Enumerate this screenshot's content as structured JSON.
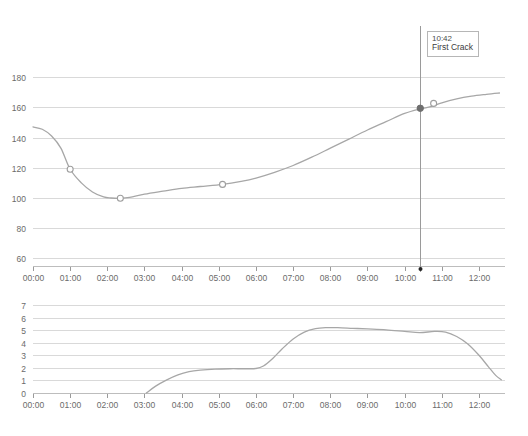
{
  "annotation": {
    "time": "10:42",
    "label": "First Crack"
  },
  "footer": {
    "faint_text": ""
  },
  "colors": {
    "grid": "#d9d9d9",
    "axis": "#bdbdbd",
    "series": "#a7a7a7",
    "marker_open_stroke": "#9e9e9e",
    "marker_filled": "#6e6e6e",
    "event_line": "#9a9a9a",
    "text": "#6b6b6b",
    "background": "#ffffff"
  },
  "chart_data": [
    {
      "type": "line",
      "name": "bean-temperature",
      "title": "",
      "xlabel": "",
      "ylabel": "",
      "xlim": [
        0,
        12.7
      ],
      "ylim": [
        55,
        190
      ],
      "yticks": [
        60,
        80,
        100,
        120,
        140,
        160,
        180
      ],
      "ytick_labels": [
        "60",
        "80",
        "100",
        "120",
        "140",
        "160",
        "180"
      ],
      "xticks": [
        0,
        1,
        2,
        3,
        4,
        5,
        6,
        7,
        8,
        9,
        10,
        11,
        12
      ],
      "xtick_labels": [
        "00:00",
        "01:00",
        "02:00",
        "03:00",
        "04:00",
        "05:00",
        "06:00",
        "07:00",
        "08:00",
        "09:00",
        "10:00",
        "11:00",
        "12:00"
      ],
      "grid": true,
      "legend": "none",
      "x": [
        0.0,
        0.25,
        0.5,
        0.75,
        1.0,
        1.3,
        1.6,
        1.9,
        2.1,
        2.35,
        2.6,
        3.0,
        3.5,
        4.0,
        4.5,
        5.1,
        5.6,
        6.0,
        6.5,
        7.0,
        7.5,
        8.0,
        8.5,
        9.0,
        9.5,
        10.0,
        10.42,
        10.7,
        11.0,
        11.4,
        11.8,
        12.2,
        12.55
      ],
      "y": [
        147,
        145.5,
        141,
        133,
        119,
        110,
        104,
        100.7,
        100.0,
        99.8,
        100.4,
        102.5,
        104.5,
        106.4,
        107.6,
        109.0,
        111.0,
        113.2,
        117.0,
        121.5,
        127.0,
        133.0,
        139.0,
        145.0,
        150.5,
        156.0,
        159.0,
        160.4,
        163.0,
        165.6,
        167.4,
        168.6,
        169.5
      ],
      "markers": [
        {
          "x": 1.0,
          "y": 119,
          "style": "open"
        },
        {
          "x": 2.35,
          "y": 99.8,
          "style": "open"
        },
        {
          "x": 5.1,
          "y": 109.0,
          "style": "open"
        },
        {
          "x": 10.42,
          "y": 159.4,
          "style": "filled"
        },
        {
          "x": 10.78,
          "y": 162.6,
          "style": "open"
        }
      ],
      "event_marker": {
        "x": 10.42,
        "label": "First Crack",
        "time": "10:42"
      }
    },
    {
      "type": "line",
      "name": "rate-of-rise",
      "title": "",
      "xlabel": "",
      "ylabel": "",
      "xlim": [
        0,
        12.7
      ],
      "ylim": [
        0,
        7.4
      ],
      "yticks": [
        0,
        1,
        2,
        3,
        4,
        5,
        6,
        7
      ],
      "ytick_labels": [
        "0",
        "1",
        "2",
        "3",
        "4",
        "5",
        "6",
        "7"
      ],
      "xticks": [
        0,
        1,
        2,
        3,
        4,
        5,
        6,
        7,
        8,
        9,
        10,
        11,
        12
      ],
      "xtick_labels": [
        "00:00",
        "01:00",
        "02:00",
        "03:00",
        "04:00",
        "05:00",
        "06:00",
        "07:00",
        "08:00",
        "09:00",
        "10:00",
        "11:00",
        "12:00"
      ],
      "grid": true,
      "legend": "none",
      "x": [
        3.05,
        3.3,
        3.6,
        3.9,
        4.2,
        4.5,
        4.9,
        5.3,
        5.7,
        6.0,
        6.2,
        6.45,
        6.7,
        7.0,
        7.3,
        7.6,
        7.9,
        8.2,
        8.6,
        9.0,
        9.5,
        10.0,
        10.4,
        10.8,
        11.1,
        11.4,
        11.7,
        12.0,
        12.25,
        12.45,
        12.6
      ],
      "y": [
        0.0,
        0.55,
        1.05,
        1.45,
        1.7,
        1.82,
        1.9,
        1.93,
        1.93,
        1.95,
        2.15,
        2.75,
        3.5,
        4.3,
        4.85,
        5.12,
        5.2,
        5.2,
        5.15,
        5.1,
        5.03,
        4.9,
        4.8,
        4.9,
        4.85,
        4.5,
        3.9,
        3.0,
        2.1,
        1.4,
        1.05
      ]
    }
  ]
}
